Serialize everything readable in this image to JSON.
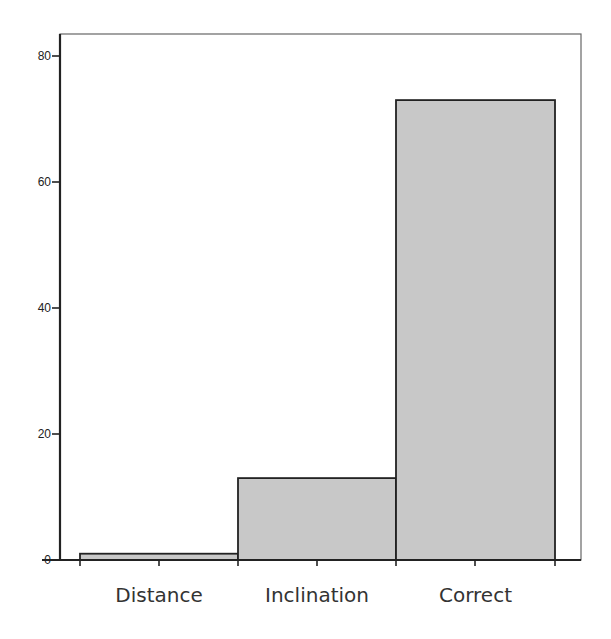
{
  "chart_data": {
    "type": "bar",
    "title": "",
    "xlabel": "",
    "ylabel": "",
    "categories": [
      "Distance",
      "Inclination",
      "Correct"
    ],
    "values": [
      1,
      13,
      73
    ],
    "ylim": [
      0,
      83
    ],
    "yticks": [
      0,
      20,
      40,
      60,
      80
    ],
    "grid": false,
    "legend": null,
    "bar_color": "#c8c8c8",
    "edge_color": "#222222"
  }
}
